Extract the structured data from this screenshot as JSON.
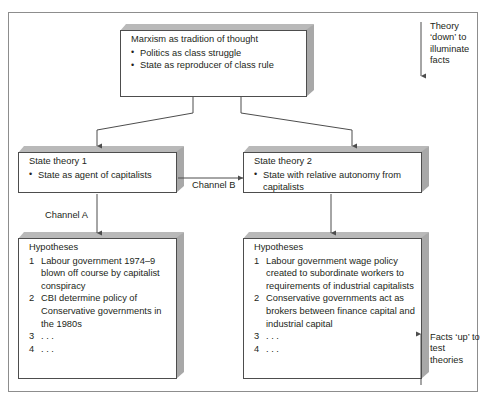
{
  "figure": {
    "boxes": {
      "top": {
        "title": "Marxism as tradition of thought",
        "bullets": [
          "Politics as class struggle",
          "State as reproducer of class rule"
        ]
      },
      "theory1": {
        "title": "State theory 1",
        "bullets": [
          "State as agent of capitalists"
        ]
      },
      "theory2": {
        "title": "State theory 2",
        "bullets": [
          "State with relative autonomy from capitalists"
        ]
      },
      "hypotheses1": {
        "title": "Hypotheses",
        "items": [
          {
            "num": "1",
            "text": "Labour government 1974–9 blown off course by capitalist conspiracy"
          },
          {
            "num": "2",
            "text": "CBI determine policy of Conservative governments in the 1980s"
          },
          {
            "num": "3",
            "text": ". . ."
          },
          {
            "num": "4",
            "text": ". . ."
          }
        ]
      },
      "hypotheses2": {
        "title": "Hypotheses",
        "items": [
          {
            "num": "1",
            "text": "Labour government wage policy created to subordinate workers to requirements of industrial capitalists"
          },
          {
            "num": "2",
            "text": "Conservative governments act as brokers between finance capital and industrial capital"
          },
          {
            "num": "3",
            "text": ". . ."
          },
          {
            "num": "4",
            "text": ". . ."
          }
        ]
      }
    },
    "labels": {
      "channel_a": "Channel A",
      "channel_b": "Channel B"
    },
    "annotations": {
      "theory_down": "Theory ‘down’ to illuminate facts",
      "facts_up": "Facts ‘up’ to test theories"
    },
    "colors": {
      "ink": "#231f20",
      "box_outline": "#4d4d4d",
      "box_shadow_top": "#b9b9b9",
      "box_shadow_side": "#a8a8a8",
      "frame": "#8d8d8d",
      "connector": "#58585a"
    }
  }
}
